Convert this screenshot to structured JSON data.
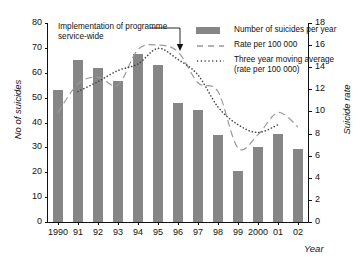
{
  "chart_data": {
    "type": "bar",
    "title": "",
    "xlabel": "Year",
    "ylabel": "No of suicides",
    "ylabel_right": "Suicide rate",
    "grid": false,
    "legend_position": "top-right",
    "categories": [
      "1990",
      "91",
      "92",
      "93",
      "94",
      "95",
      "96",
      "97",
      "98",
      "99",
      "2000",
      "01",
      "02"
    ],
    "full_years": [
      1990,
      1991,
      1992,
      1993,
      1994,
      1995,
      1996,
      1997,
      1998,
      1999,
      2000,
      2001,
      2002
    ],
    "ylim": [
      0,
      80
    ],
    "yticks": [
      0,
      10,
      20,
      30,
      40,
      50,
      60,
      70,
      80
    ],
    "ylim_right": [
      0,
      18
    ],
    "yticks_right": [
      0,
      2,
      4,
      6,
      8,
      10,
      12,
      14,
      16,
      18
    ],
    "series": [
      {
        "name": "Number of suicides per year",
        "type": "bar",
        "axis": "left",
        "color": "#868686",
        "values": [
          53,
          65,
          62,
          56.5,
          67.5,
          63,
          48,
          45,
          35,
          20.5,
          30,
          35.5,
          29.5
        ]
      },
      {
        "name": "Rate per 100 000",
        "type": "line",
        "style": "dashed",
        "axis": "right",
        "color": "#9a9a9a",
        "values": [
          9.9,
          12.5,
          13.1,
          12.4,
          15.6,
          16.0,
          15.4,
          12.6,
          11.8,
          6.7,
          7.9,
          9.9,
          8.6
        ]
      },
      {
        "name": "Three year moving average (rate per 100 000)",
        "type": "line",
        "style": "dotted",
        "axis": "right",
        "color": "#444444",
        "values": [
          null,
          11.8,
          12.7,
          13.7,
          14.3,
          15.7,
          14.7,
          13.3,
          10.4,
          8.8,
          8.1,
          8.8,
          null
        ]
      }
    ],
    "annotations": [
      {
        "name": "implementation-annotation",
        "line1": "Implementation of programme",
        "line2": "service-wide",
        "points_to_year": "96",
        "arrow": "down"
      }
    ]
  },
  "legend": {
    "items": [
      {
        "label": "Number of suicides per year",
        "label2": "",
        "symbol": "bar-swatch"
      },
      {
        "label": "Rate per 100 000",
        "label2": "",
        "symbol": "dashed-line"
      },
      {
        "label": "Three year moving average",
        "label2": "(rate per 100 000)",
        "symbol": "dotted-line"
      }
    ]
  }
}
